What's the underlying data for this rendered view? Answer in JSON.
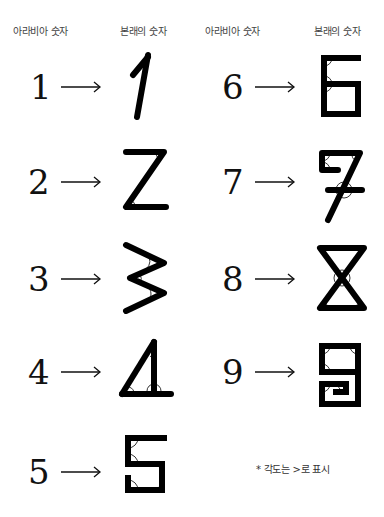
{
  "headers": {
    "left_arabic": "아라비아 숫자",
    "left_original": "본래의 숫자",
    "right_arabic": "아라비아 숫자",
    "right_original": "본래의 숫자"
  },
  "rows": [
    {
      "arabic": "1",
      "original_glyph": "one-stroke-no-angle"
    },
    {
      "arabic": "2",
      "original_glyph": "z-shape-two-angles"
    },
    {
      "arabic": "3",
      "original_glyph": "zigzag-three-angles"
    },
    {
      "arabic": "4",
      "original_glyph": "triangle-four-angles"
    },
    {
      "arabic": "5",
      "original_glyph": "s-box-five-angles"
    },
    {
      "arabic": "6",
      "original_glyph": "box-six-angles"
    },
    {
      "arabic": "7",
      "original_glyph": "crossed-seven-angles"
    },
    {
      "arabic": "8",
      "original_glyph": "hourglass-eight-angles"
    },
    {
      "arabic": "9",
      "original_glyph": "spiral-box-nine-angles"
    }
  ],
  "arrow_symbol": "→",
  "note": "* 각도는 >로 표시",
  "colors": {
    "ink": "#111111",
    "label": "#444444"
  }
}
